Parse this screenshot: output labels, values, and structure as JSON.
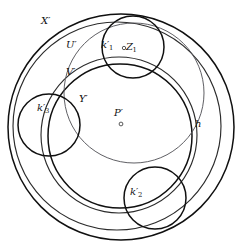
{
  "figure": {
    "background_color": "#ffffff",
    "stroke_color": "#1a1a1a",
    "width": 242,
    "height": 251
  },
  "labels": {
    "X_prime": "X",
    "U_prime": "U",
    "V_prime": "V",
    "Y_prime": "Y",
    "P_prime": "P",
    "k1_prime": "k",
    "k1_sub": "1",
    "Z1": "Z",
    "Z1_sub": "1",
    "k2_prime": "k",
    "k2_sub": "2",
    "k3_prime": "k",
    "k3_sub": "3",
    "h": "h",
    "prime_mark": "′"
  },
  "chart_data": {
    "type": "diagram",
    "xlabel": "",
    "ylabel": "",
    "coordinate_space": {
      "width": 242,
      "height": 251,
      "units": "pixels"
    },
    "shapes": [
      {
        "name": "X_prime",
        "label": "X′",
        "type": "circle",
        "cx": 121,
        "cy": 127,
        "r": 113,
        "weight": "dark"
      },
      {
        "name": "U_prime",
        "label": "U′",
        "type": "circle",
        "cx": 117,
        "cy": 126,
        "r": 104,
        "weight": "mid"
      },
      {
        "name": "V_prime",
        "label": "V′",
        "type": "circle",
        "cx": 119,
        "cy": 135,
        "r": 78,
        "weight": "mid"
      },
      {
        "name": "Y_prime",
        "label": "Y′",
        "type": "circle",
        "cx": 120,
        "cy": 136,
        "r": 72,
        "weight": "dark"
      },
      {
        "name": "h",
        "label": "h",
        "type": "circle",
        "cx": 134,
        "cy": 93,
        "r": 70,
        "weight": "light"
      },
      {
        "name": "k1_prime",
        "label": "k′₁",
        "type": "circle",
        "cx": 133,
        "cy": 47,
        "r": 31,
        "weight": "dark"
      },
      {
        "name": "k2_prime",
        "label": "k′₂",
        "type": "circle",
        "cx": 155,
        "cy": 198,
        "r": 31,
        "weight": "dark"
      },
      {
        "name": "k3_prime",
        "label": "k′₃",
        "type": "circle",
        "cx": 49,
        "cy": 125,
        "r": 31,
        "weight": "dark"
      }
    ],
    "points": [
      {
        "name": "P_prime",
        "label": "P′",
        "x": 121,
        "y": 124,
        "marker": "open-circle"
      },
      {
        "name": "Z1",
        "label": "Z₁",
        "x": 124,
        "y": 48,
        "marker": "open-circle"
      }
    ]
  }
}
